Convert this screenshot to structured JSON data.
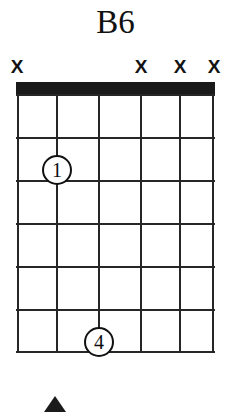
{
  "chord": {
    "name": "B6",
    "instrument": "guitar",
    "string_count": 6,
    "fret_count": 6,
    "nut_shown": true,
    "starting_fret": 1,
    "string_markers": [
      {
        "string": 1,
        "symbol": "X",
        "meaning": "muted",
        "x": 17
      },
      {
        "string": 2,
        "symbol": "",
        "meaning": "fretted",
        "x": 56
      },
      {
        "string": 3,
        "symbol": "",
        "meaning": "fretted",
        "x": 99
      },
      {
        "string": 4,
        "symbol": "X",
        "meaning": "muted",
        "x": 141
      },
      {
        "string": 5,
        "symbol": "X",
        "meaning": "muted",
        "x": 180
      },
      {
        "string": 6,
        "symbol": "X",
        "meaning": "muted",
        "x": 214
      }
    ],
    "strings_x": [
      0,
      40,
      82,
      124,
      163,
      197
    ],
    "frets_y": [
      0,
      43,
      86,
      129,
      172,
      215,
      258
    ],
    "fingerings": [
      {
        "label": "1",
        "string": 2,
        "fret": 2,
        "cx": 40,
        "cy": 76
      },
      {
        "label": "4",
        "string": 3,
        "fret": 6,
        "cx": 82,
        "cy": 248
      }
    ],
    "colors": {
      "ink": "#1a1a1a",
      "line": "#262626",
      "background": "#ffffff"
    },
    "bottom_glyph": "triangle-arrow"
  }
}
